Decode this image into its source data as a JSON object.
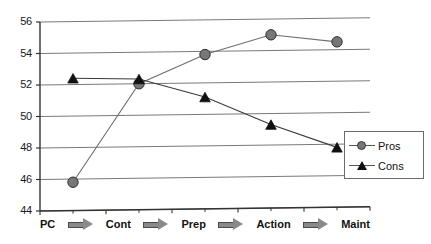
{
  "chart_data": {
    "type": "line",
    "title": "",
    "xlabel": "",
    "ylabel": "",
    "categories": [
      "PC",
      "Cont",
      "Prep",
      "Action",
      "Maint"
    ],
    "category_separator": "arrow-right-icon",
    "series": [
      {
        "name": "Pros",
        "marker": "circle",
        "color": "#777777",
        "values": [
          45.8,
          52.0,
          53.8,
          55.0,
          54.5
        ]
      },
      {
        "name": "Cons",
        "marker": "triangle",
        "color": "#111111",
        "values": [
          52.4,
          52.3,
          51.1,
          49.3,
          47.8
        ]
      }
    ],
    "ylim": [
      44,
      56
    ],
    "ytick_step": 2,
    "yticks": [
      "44",
      "46",
      "48",
      "50",
      "52",
      "54",
      "56"
    ],
    "grid": true,
    "grid_color": "#7a7a7a",
    "legend_position": "right",
    "legend_entries": [
      "Pros",
      "Cons"
    ],
    "axis_color": "#333333",
    "background": "#ffffff"
  },
  "axis": {
    "yticks": [
      "56",
      "54",
      "52",
      "50",
      "48",
      "46",
      "44"
    ]
  },
  "legend": {
    "items": [
      {
        "label": "Pros"
      },
      {
        "label": "Cons"
      }
    ]
  }
}
